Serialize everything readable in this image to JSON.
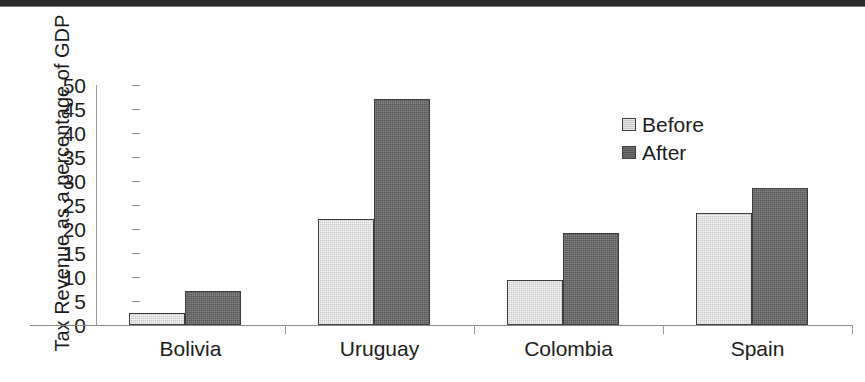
{
  "chart_data": {
    "type": "bar",
    "title": "",
    "xlabel": "",
    "ylabel": "Tax Revenue as a percentage of GDP",
    "ylim": [
      0,
      50
    ],
    "ytick_step": 5,
    "ytick_labels": [
      "50",
      "45",
      "40",
      "35",
      "30",
      "25",
      "20",
      "15",
      "10",
      "5",
      "0"
    ],
    "grid": false,
    "legend_position": "right",
    "categories": [
      "Bolivia",
      "Uruguay",
      "Colombia",
      "Spain"
    ],
    "series": [
      {
        "name": "Before",
        "color": "#c9c9c9",
        "values": [
          2.5,
          22,
          9.3,
          23.3
        ]
      },
      {
        "name": "After",
        "color": "#565656",
        "values": [
          7,
          47,
          19.2,
          28.5
        ]
      }
    ]
  },
  "legend": {
    "items": [
      {
        "label": "Before"
      },
      {
        "label": "After"
      }
    ]
  }
}
